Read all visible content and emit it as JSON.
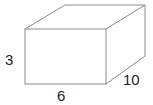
{
  "diagram": {
    "type": "rectangular-prism",
    "labels": {
      "height": "3",
      "width": "6",
      "depth": "10"
    },
    "colors": {
      "edge": "#8a8a8a",
      "text": "#222222",
      "background": "#ffffff"
    }
  }
}
